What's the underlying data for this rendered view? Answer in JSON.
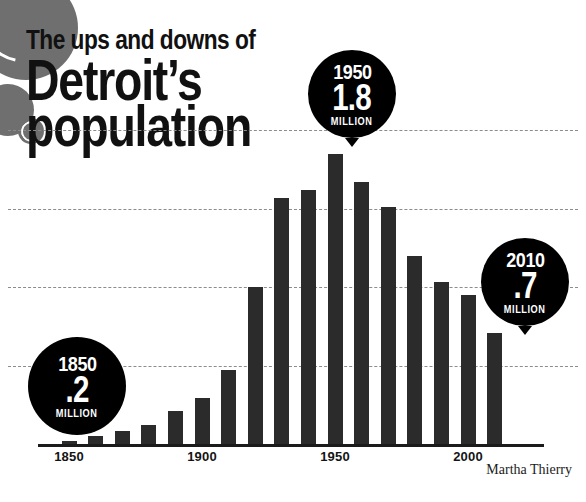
{
  "headline": {
    "line1": "The ups and downs of",
    "line2": "Detroit’s",
    "line3": "population"
  },
  "credit": "Martha Thierry",
  "colors": {
    "bar": "#2b2b2b",
    "bubble": "#000000",
    "bubble_text": "#ffffff",
    "gridline": "#8c8c8c",
    "axis": "#1b1b1b",
    "decoration": "#6f6f6f",
    "background": "#ffffff"
  },
  "callouts": [
    {
      "name": "callout-1850",
      "year": "1850",
      "value": ".2",
      "unit": "MILLION"
    },
    {
      "name": "callout-1950",
      "year": "1950",
      "value": "1.8",
      "unit": "MILLION"
    },
    {
      "name": "callout-2010",
      "year": "2010",
      "value": ".7",
      "unit": "MILLION"
    }
  ],
  "chart_data": {
    "type": "bar",
    "title": "The ups and downs of Detroit’s population",
    "xlabel": "",
    "ylabel": "",
    "ylim": [
      0,
      2.0
    ],
    "grid": true,
    "gridlines": [
      0.5,
      1.0,
      1.5,
      2.0
    ],
    "legend": "none",
    "units": "millions",
    "tick_labels": [
      "1850",
      "1900",
      "1950",
      "2000"
    ],
    "categories": [
      "1850",
      "1860",
      "1870",
      "1880",
      "1890",
      "1900",
      "1910",
      "1920",
      "1930",
      "1940",
      "1950",
      "1960",
      "1970",
      "1980",
      "1990",
      "2000",
      "2010"
    ],
    "values": [
      0.02,
      0.05,
      0.08,
      0.12,
      0.21,
      0.29,
      0.47,
      1.0,
      1.57,
      1.62,
      1.85,
      1.67,
      1.51,
      1.2,
      1.03,
      0.95,
      0.71
    ],
    "annotations": [
      {
        "category": "1850",
        "label": "1850 .2 MILLION"
      },
      {
        "category": "1950",
        "label": "1950 1.8 MILLION"
      },
      {
        "category": "2010",
        "label": "2010 .7 MILLION"
      }
    ]
  }
}
